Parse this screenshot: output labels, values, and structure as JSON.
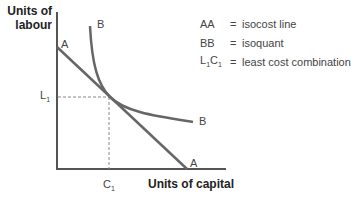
{
  "diagram": {
    "y_axis_title_line1": "Units of",
    "y_axis_title_line2": "labour",
    "x_axis_title": "Units of capital",
    "isocost_label_start": "A",
    "isocost_label_end": "A",
    "isoquant_label_start": "B",
    "isoquant_label_end": "B",
    "l1_label": "L",
    "l1_sub": "1",
    "c1_label": "C",
    "c1_sub": "1",
    "colors": {
      "curve": "#666666",
      "axis": "#555555",
      "dashed": "#888888"
    }
  },
  "legend": {
    "items": [
      {
        "key": "AA",
        "eq": "=",
        "desc": "isocost line"
      },
      {
        "key": "BB",
        "eq": "=",
        "desc": "isoquant"
      },
      {
        "key_main": "L",
        "key_sub1": "1",
        "key_main2": "C",
        "key_sub2": "1",
        "eq": "=",
        "desc": "least cost combination"
      }
    ]
  }
}
